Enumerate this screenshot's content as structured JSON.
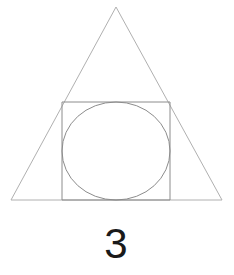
{
  "figure": {
    "canvas": {
      "width": 234,
      "height": 275,
      "background_color": "#ffffff"
    },
    "label": {
      "text": "3",
      "color": "#1a1a1a",
      "center_x": 116,
      "baseline_y": 258,
      "font_size": 42
    },
    "shapes": {
      "triangle": {
        "name": "triangle",
        "stroke_color": "#b0b0b0",
        "stroke_width": 1,
        "fill": "none",
        "points": "116,7 222,200 11,200",
        "vertices": [
          {
            "label": "apex",
            "x": 116,
            "y": 7
          },
          {
            "label": "bottom-right",
            "x": 222,
            "y": 200
          },
          {
            "label": "bottom-left",
            "x": 11,
            "y": 200
          }
        ],
        "base_width": 211,
        "height": 193
      },
      "square": {
        "name": "square",
        "stroke_color": "#8c8c8c",
        "stroke_width": 1,
        "fill": "none",
        "x": 62,
        "y": 102,
        "width": 108,
        "height": 98
      },
      "circle": {
        "name": "circle",
        "stroke_color": "#8c8c8c",
        "stroke_width": 1,
        "fill": "none",
        "center_x": 116,
        "center_y": 151,
        "radius_x": 54,
        "radius_y": 49,
        "inscribed_in": "square"
      }
    },
    "shape_count": 3
  }
}
